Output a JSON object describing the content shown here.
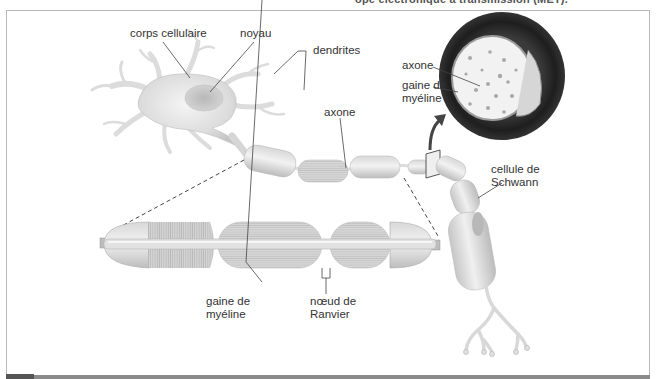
{
  "caption": {
    "top_text": "ope électronique à transmission (MET)."
  },
  "diagram": {
    "labels": {
      "corps_cellulaire": "corps cellulaire",
      "noyau": "noyau",
      "dendrites": "dendrites",
      "axone_main": "axone",
      "axone_cross_section": "axone",
      "gaine_cross_section_line1": "gaine de",
      "gaine_cross_section_line2": "myéline",
      "cellule_schwann_line1": "cellule de",
      "cellule_schwann_line2": "Schwann",
      "gaine_detail_line1": "gaine de",
      "gaine_detail_line2": "myéline",
      "noeud_line1": "nœud de",
      "noeud_line2": "Ranvier"
    },
    "colors": {
      "cell_fill": "#e6e6e6",
      "cell_shadow": "#c8c8c8",
      "myelin_dark": "#2a2a2a",
      "leader_line": "#444444",
      "frame": "#b8b8b8"
    }
  }
}
